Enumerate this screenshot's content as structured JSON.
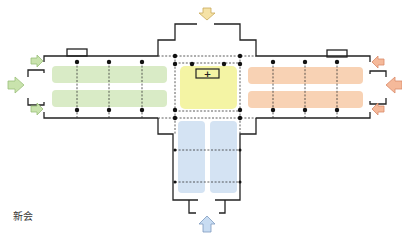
{
  "caption": "新会",
  "colors": {
    "green_zone": "#d9ebc6",
    "yellow_zone": "#f4f4a4",
    "orange_zone": "#f8d2b4",
    "blue_zone": "#d4e3f3",
    "green_arrow": "#c9e3ad",
    "yellow_arrow": "#f5e2a6",
    "orange_arrow": "#f5b99a",
    "blue_arrow": "#c8dcf2",
    "wall": "#222222"
  },
  "center_symbol": "+",
  "zones": [
    {
      "name": "west-wing",
      "color": "green"
    },
    {
      "name": "center-hall",
      "color": "yellow"
    },
    {
      "name": "east-wing",
      "color": "orange"
    },
    {
      "name": "south-wing",
      "color": "blue"
    }
  ],
  "entrances": [
    {
      "side": "north",
      "arrow": "down"
    },
    {
      "side": "west",
      "arrow": "right"
    },
    {
      "side": "east",
      "arrow": "left"
    },
    {
      "side": "south",
      "arrow": "up"
    }
  ]
}
